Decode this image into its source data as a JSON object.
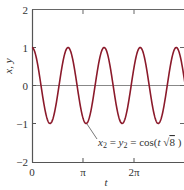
{
  "chart_data": {
    "type": "line",
    "title": "",
    "xlabel": "t",
    "ylabel": "x, y",
    "xlim": [
      0,
      9.42
    ],
    "ylim": [
      -2,
      2
    ],
    "x_ticks": [
      {
        "value": 0,
        "label": "0"
      },
      {
        "value": 3.14159,
        "label": "π"
      },
      {
        "value": 6.28319,
        "label": "2π"
      }
    ],
    "y_ticks": [
      {
        "value": 2,
        "label": "2"
      },
      {
        "value": 1,
        "label": "1"
      },
      {
        "value": 0,
        "label": "0"
      },
      {
        "value": -1,
        "label": "−1"
      },
      {
        "value": -2,
        "label": "−2"
      }
    ],
    "grid": false,
    "zero_line": true,
    "series": [
      {
        "name": "x2 = y2 = cos(t√8)",
        "expression": "cos(t*sqrt(8))",
        "color": "#8b1a2b",
        "x_range": [
          0,
          9.42
        ]
      }
    ],
    "annotations": [
      {
        "text_parts": {
          "x": "x",
          "x_sub": "2",
          "eq1": " = ",
          "y": "y",
          "y_sub": "2",
          "eq2": " = cos(",
          "t": "t",
          "sqrt": " √",
          "radicand": "8",
          "close": " )"
        },
        "points_to": {
          "t": 3.33,
          "value": -1
        }
      }
    ],
    "colors": {
      "curve": "#8b1a2b",
      "axis": "#555555",
      "zero_line": "#888888",
      "text": "#333333"
    }
  }
}
